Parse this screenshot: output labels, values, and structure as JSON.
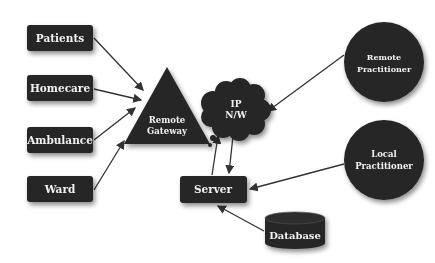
{
  "diagram": {
    "colors": {
      "node_fill": "#262626",
      "text": "#f2f2f2",
      "edge": "#333333",
      "background": "#ffffff"
    },
    "nodes": {
      "patients": {
        "label": "Patients",
        "shape": "rect"
      },
      "homecare": {
        "label": "Homecare",
        "shape": "rect"
      },
      "ambulance": {
        "label": "Ambulance",
        "shape": "rect"
      },
      "ward": {
        "label": "Ward",
        "shape": "rect"
      },
      "gateway": {
        "line1": "Remote",
        "line2": "Gateway",
        "shape": "triangle"
      },
      "network": {
        "line1": "IP",
        "line2": "N/W",
        "shape": "cloud"
      },
      "server": {
        "label": "Server",
        "shape": "rect"
      },
      "database": {
        "label": "Database",
        "shape": "cylinder"
      },
      "remote_practitioner": {
        "line1": "Remote",
        "line2": "Practitioner",
        "shape": "circle"
      },
      "local_practitioner": {
        "line1": "Local",
        "line2": "Practitioner",
        "shape": "circle"
      }
    },
    "edges": [
      {
        "from": "Patients",
        "to": "Remote Gateway"
      },
      {
        "from": "Homecare",
        "to": "Remote Gateway"
      },
      {
        "from": "Ambulance",
        "to": "Remote Gateway"
      },
      {
        "from": "Ward",
        "to": "Remote Gateway"
      },
      {
        "from": "Remote Practitioner",
        "to": "IP N/W"
      },
      {
        "from": "Server",
        "to": "IP N/W"
      },
      {
        "from": "IP N/W",
        "to": "Server"
      },
      {
        "from": "Local Practitioner",
        "to": "Server"
      },
      {
        "from": "Database",
        "to": "Server"
      }
    ]
  }
}
